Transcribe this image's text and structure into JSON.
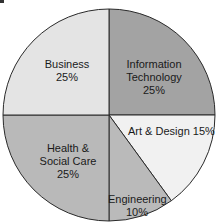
{
  "chart_data": {
    "type": "pie",
    "title": "",
    "start_angle_deg": 0,
    "direction": "clockwise",
    "slices": [
      {
        "label": "Information Technology",
        "value": 25,
        "display": [
          "Information",
          "Technology",
          "25%"
        ],
        "color": "#a3a3a3"
      },
      {
        "label": "Art & Design",
        "value": 15,
        "display": [
          "Art & Design 15%"
        ],
        "color": "#f1f1f1"
      },
      {
        "label": "Engineering",
        "value": 10,
        "display": [
          "Engineering",
          "10%"
        ],
        "color": "#bababa"
      },
      {
        "label": "Health & Social Care",
        "value": 25,
        "display": [
          "Health &",
          "Social Care",
          "25%"
        ],
        "color": "#b9b9b9"
      },
      {
        "label": "Business",
        "value": 25,
        "display": [
          "Business",
          "25%"
        ],
        "color": "#e4e4e4"
      }
    ],
    "categories": [
      "Information Technology",
      "Art & Design",
      "Engineering",
      "Health & Social Care",
      "Business"
    ],
    "values": [
      25,
      15,
      10,
      25,
      25
    ],
    "units": "%",
    "legend": "none (labels inside slices)"
  },
  "labels": {
    "business": {
      "line1": "Business",
      "line2": "25%"
    },
    "it": {
      "line1": "Information",
      "line2": "Technology",
      "line3": "25%"
    },
    "art": {
      "line1": "Art & Design 15%"
    },
    "health": {
      "line1": "Health &",
      "line2": "Social Care",
      "line3": "25%"
    },
    "engineering": {
      "line1": "Engineering",
      "line2": "10%"
    }
  },
  "style": {
    "outline_color": "#2a2a2a",
    "background": "#ffffff"
  }
}
